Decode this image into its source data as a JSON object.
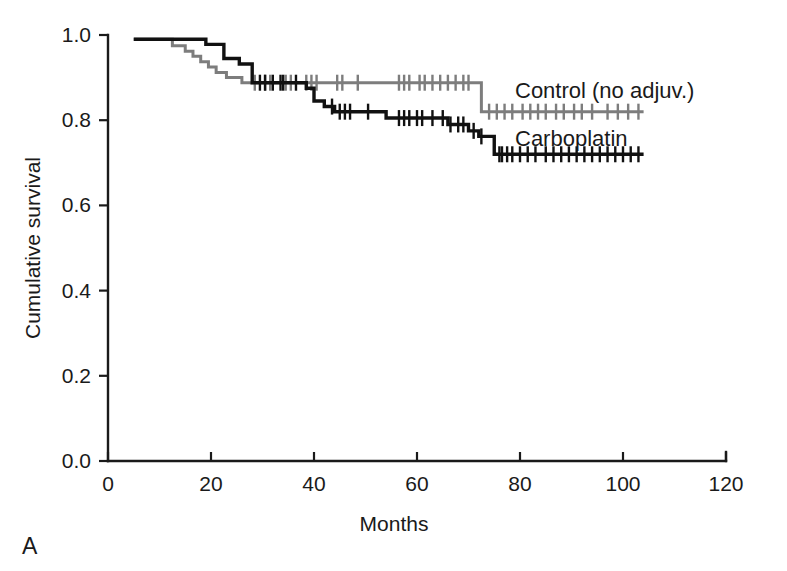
{
  "figure": {
    "panel_letter": "A",
    "background_color": "#ffffff"
  },
  "chart_data": {
    "type": "line",
    "subtype": "kaplan-meier-survival",
    "title": "",
    "xlabel": "Months",
    "ylabel": "Cumulative survival",
    "xlim": [
      0,
      120
    ],
    "ylim": [
      0.0,
      1.0
    ],
    "xticks": [
      0,
      20,
      40,
      60,
      80,
      100,
      120
    ],
    "xtick_labels": [
      "0",
      "20",
      "40",
      "60",
      "80",
      "100",
      "120"
    ],
    "yticks": [
      0.0,
      0.2,
      0.4,
      0.6,
      0.8,
      1.0
    ],
    "ytick_labels": [
      "0.0",
      "0.2",
      "0.4",
      "0.6",
      "0.8",
      "1.0"
    ],
    "grid": false,
    "legend_position": "inline-right",
    "series": [
      {
        "name": "Control (no adjuv.)",
        "color": "#7d7d7d",
        "label_x": 104,
        "label_y": 0.885,
        "steps": [
          [
            5,
            0.99
          ],
          [
            12.5,
            0.99
          ],
          [
            12.5,
            0.975
          ],
          [
            15,
            0.975
          ],
          [
            15,
            0.962
          ],
          [
            16.5,
            0.962
          ],
          [
            16.5,
            0.95
          ],
          [
            18,
            0.95
          ],
          [
            18,
            0.937
          ],
          [
            19.5,
            0.937
          ],
          [
            19.5,
            0.925
          ],
          [
            21,
            0.925
          ],
          [
            21,
            0.912
          ],
          [
            23,
            0.912
          ],
          [
            23,
            0.9
          ],
          [
            26,
            0.9
          ],
          [
            26,
            0.888
          ],
          [
            40,
            0.888
          ],
          [
            40,
            0.888
          ],
          [
            48,
            0.888
          ],
          [
            48,
            0.888
          ],
          [
            72.5,
            0.888
          ],
          [
            72.5,
            0.82
          ],
          [
            104,
            0.82
          ]
        ],
        "censor_times": [
          28.5,
          30.5,
          31.5,
          34.5,
          35.5,
          38.5,
          39.5,
          40.5,
          44.5,
          45.5,
          48.5,
          56.5,
          57.5,
          58.5,
          60.5,
          61.5,
          63.0,
          64.5,
          66.0,
          67.5,
          69.0,
          70.0,
          74.0,
          75.5,
          77.0,
          78.5,
          80.5,
          82.0,
          83.5,
          85.0,
          87.0,
          88.5,
          90.5,
          92.0,
          94.0,
          97.0,
          99.0,
          101.0,
          103.0
        ]
      },
      {
        "name": "Carboplatin",
        "color": "#111111",
        "label_x": 104,
        "label_y": 0.785,
        "steps": [
          [
            5,
            0.99
          ],
          [
            19,
            0.99
          ],
          [
            19,
            0.978
          ],
          [
            22.5,
            0.978
          ],
          [
            22.5,
            0.945
          ],
          [
            25.5,
            0.945
          ],
          [
            25.5,
            0.932
          ],
          [
            28,
            0.932
          ],
          [
            28,
            0.888
          ],
          [
            38.5,
            0.888
          ],
          [
            38.5,
            0.875
          ],
          [
            40,
            0.875
          ],
          [
            40,
            0.845
          ],
          [
            42,
            0.845
          ],
          [
            42,
            0.832
          ],
          [
            44,
            0.832
          ],
          [
            44,
            0.82
          ],
          [
            54,
            0.82
          ],
          [
            54,
            0.805
          ],
          [
            66,
            0.805
          ],
          [
            66,
            0.79
          ],
          [
            70,
            0.79
          ],
          [
            70,
            0.775
          ],
          [
            72,
            0.775
          ],
          [
            72,
            0.762
          ],
          [
            75,
            0.762
          ],
          [
            75,
            0.72
          ],
          [
            104,
            0.72
          ]
        ],
        "censor_times": [
          29.5,
          30.5,
          32.0,
          33.5,
          34.0,
          36.5,
          43.5,
          45.0,
          46.0,
          47.0,
          50.5,
          56.5,
          57.5,
          58.5,
          60.0,
          61.0,
          63.0,
          65.0,
          66.5,
          68.0,
          69.0,
          71.0,
          72.5,
          76.0,
          76.5,
          77.5,
          78.5,
          80.0,
          81.5,
          83.0,
          85.0,
          86.5,
          88.0,
          89.5,
          91.0,
          92.5,
          94.0,
          95.5,
          97.0,
          98.5,
          100.0,
          101.5,
          103.0
        ]
      }
    ]
  }
}
